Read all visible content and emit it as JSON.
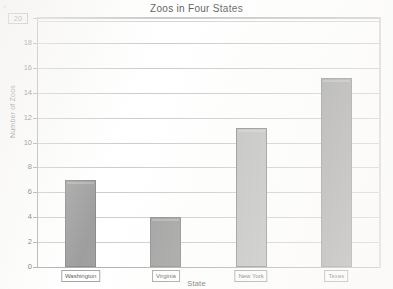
{
  "chart_data": {
    "type": "bar",
    "title": "Zoos in Four States",
    "xlabel": "State",
    "ylabel": "Number of Zoos",
    "categories": [
      "Washington",
      "Virginia",
      "New York",
      "Texas"
    ],
    "values": [
      7,
      4,
      11.2,
      15.2
    ],
    "ylim": [
      0,
      20
    ],
    "ytick_step": 2,
    "yticks": [
      "0",
      "2",
      "4",
      "6",
      "8",
      "10",
      "12",
      "14",
      "16",
      "18",
      "20"
    ],
    "grid": true,
    "legend": "none",
    "bar_colors": [
      "#868686",
      "#868686",
      "#aeaeae",
      "#8a8a8a"
    ],
    "bar_border_color": "#6e6e6e"
  },
  "axis": {
    "y_max_label": "20",
    "y_min_label": "0"
  }
}
